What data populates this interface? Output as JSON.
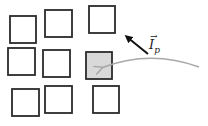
{
  "diagram": {
    "squares": [
      {
        "id": "r1c1",
        "x": 10,
        "y": 16,
        "w": 26,
        "h": 27,
        "fill": "#ffffff"
      },
      {
        "id": "r1c2",
        "x": 45,
        "y": 10,
        "w": 27,
        "h": 27,
        "fill": "#ffffff"
      },
      {
        "id": "r1c3",
        "x": 89,
        "y": 6,
        "w": 26,
        "h": 27,
        "fill": "#ffffff"
      },
      {
        "id": "r2c1",
        "x": 8,
        "y": 48,
        "w": 27,
        "h": 27,
        "fill": "#ffffff"
      },
      {
        "id": "r2c2",
        "x": 43,
        "y": 50,
        "w": 27,
        "h": 27,
        "fill": "#ffffff"
      },
      {
        "id": "r2c3",
        "x": 86,
        "y": 52,
        "w": 26,
        "h": 27,
        "fill": "#d9d9d9"
      },
      {
        "id": "r3c1",
        "x": 12,
        "y": 89,
        "w": 27,
        "h": 27,
        "fill": "#ffffff"
      },
      {
        "id": "r3c2",
        "x": 45,
        "y": 86,
        "w": 27,
        "h": 27,
        "fill": "#ffffff"
      },
      {
        "id": "r3c3",
        "x": 93,
        "y": 86,
        "w": 26,
        "h": 27,
        "fill": "#ffffff"
      }
    ],
    "stroke_color": "#2b2b2b",
    "arrow_black": {
      "x1": 148,
      "y1": 54,
      "x2": 127,
      "y2": 37,
      "color": "#111111"
    },
    "curve_gray": {
      "color": "#a8a8a8"
    },
    "label": {
      "base": "I",
      "subscript": "p",
      "vector_mark": "→"
    }
  }
}
